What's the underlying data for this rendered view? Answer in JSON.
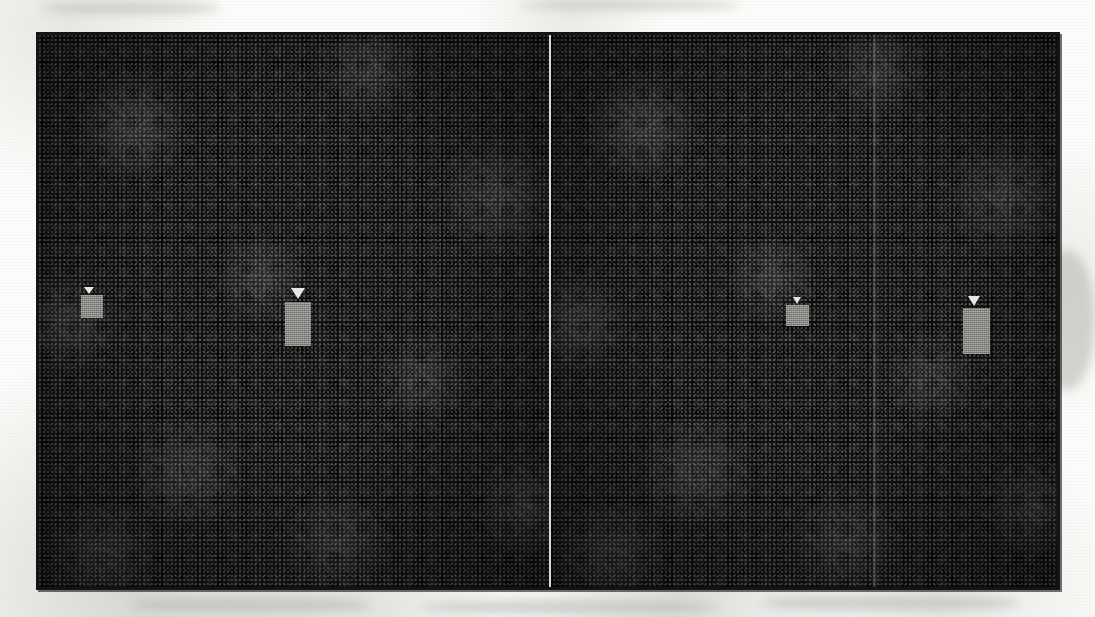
{
  "figure": {
    "panel_count": 2,
    "frame": {
      "left": 36,
      "top": 32,
      "width": 1024,
      "height": 558,
      "border_color": "#141414",
      "border_width": 3
    },
    "background_color": "#fcfcfa",
    "panel_background_color": "#191919"
  },
  "panels": [
    {
      "id": "panel-left",
      "label": "Left image panel",
      "width": 510,
      "background_color": "#191919",
      "texture": "speckle-noise"
    },
    {
      "id": "panel-right",
      "label": "Right image panel",
      "width": 508,
      "background_color": "#191919",
      "texture": "speckle-noise"
    }
  ],
  "dividers": [
    {
      "id": "divider-main",
      "label": "Panel separator line",
      "x": 549,
      "width": 2,
      "color": "#e8e8e4",
      "style": "solid-light"
    },
    {
      "id": "divider-faint",
      "label": "Faint vertical band",
      "x": 872,
      "width": 5,
      "color": "#969696",
      "style": "faint-gradient"
    }
  ],
  "markers": [
    {
      "id": "marker-1",
      "label": "Marker 1",
      "panel": "panel-left",
      "triangle": {
        "x": 84,
        "y": 287,
        "width": 10,
        "height": 7,
        "color": "#e6e6e2"
      },
      "block": {
        "x": 81,
        "y": 295,
        "width": 22,
        "height": 23,
        "color": "#8e8e8a"
      }
    },
    {
      "id": "marker-2",
      "label": "Marker 2",
      "panel": "panel-left",
      "triangle": {
        "x": 291,
        "y": 288,
        "width": 15,
        "height": 11,
        "color": "#e6e6e2"
      },
      "block": {
        "x": 285,
        "y": 302,
        "width": 26,
        "height": 44,
        "color": "#8e8e8a"
      }
    },
    {
      "id": "marker-3",
      "label": "Marker 3",
      "panel": "panel-right",
      "triangle": {
        "x": 793,
        "y": 297,
        "width": 9,
        "height": 7,
        "color": "#e6e6e2"
      },
      "block": {
        "x": 786,
        "y": 305,
        "width": 23,
        "height": 21,
        "color": "#8e8e8a"
      }
    },
    {
      "id": "marker-4",
      "label": "Marker 4",
      "panel": "panel-right",
      "triangle": {
        "x": 968,
        "y": 296,
        "width": 13,
        "height": 10,
        "color": "#e6e6e2"
      },
      "block": {
        "x": 963,
        "y": 308,
        "width": 27,
        "height": 46,
        "color": "#8e8e8a"
      }
    }
  ],
  "paper_artifacts": [
    {
      "id": "smudge-bottom-1",
      "x": 130,
      "y": 596,
      "width": 240,
      "height": 18
    },
    {
      "id": "smudge-bottom-2",
      "x": 420,
      "y": 600,
      "width": 300,
      "height": 14
    },
    {
      "id": "smudge-bottom-3",
      "x": 760,
      "y": 595,
      "width": 260,
      "height": 16
    },
    {
      "id": "smudge-top-1",
      "x": 40,
      "y": 2,
      "width": 180,
      "height": 12
    },
    {
      "id": "smudge-top-2",
      "x": 520,
      "y": 0,
      "width": 220,
      "height": 10
    },
    {
      "id": "smudge-right-1",
      "x": 1040,
      "y": 250,
      "width": 55,
      "height": 140
    }
  ]
}
